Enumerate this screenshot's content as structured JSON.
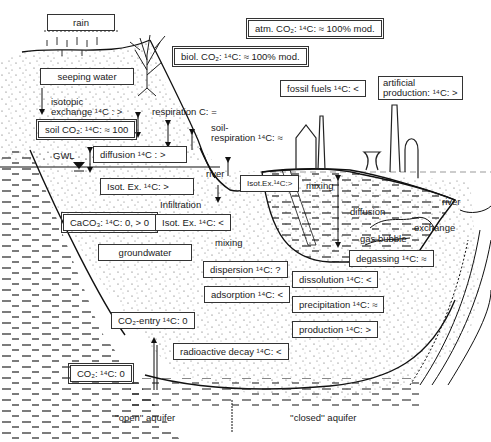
{
  "diagram": {
    "labels": {
      "rain": "rain",
      "atm_co2": "atm. CO₂: ¹⁴C: ≈ 100% mod.",
      "biol_co2": "biol. CO₂: ¹⁴C: ≈ 100% mod.",
      "seeping_water": "seeping water",
      "isotopic_exchange_1": "isotopic",
      "isotopic_exchange_2": "exchange ¹⁴C : >",
      "respiration": "respiration C: =",
      "soil_respiration_1": "soil-",
      "soil_respiration_2": "respiration ¹⁴C: ≈",
      "soil_co2": "soil CO₂: ¹⁴C: ≈ 100",
      "fossil_fuels": "fossil fuels ¹⁴C: <",
      "artificial_1": "artificial",
      "artificial_2": "production: ¹⁴C: >",
      "gwl": "GWL",
      "diffusion_top": "diffusion ¹⁴C : >",
      "river_left": "river",
      "isot_ex_lake": "Isot.Ex.¹⁴C:>",
      "mixing_lake": "mixing",
      "isot_ex_gt": "Isot. Ex. ¹⁴C: >",
      "infiltration": "Infiltration",
      "diffusion_lake": "diffusion",
      "river_right": "river",
      "caco3": "CaCO₃: ¹⁴C: 0, > 0",
      "isot_ex_lt": "Isot. Ex. ¹⁴C: <",
      "gas_bubble": "gas bubble",
      "exchange": "exchange",
      "mixing_mid": "mixing",
      "groundwater": "groundwater",
      "degassing": "degassing ¹⁴C: ≈",
      "dispersion": "dispersion ¹⁴C: ?",
      "dissolution": "dissolution ¹⁴C: <",
      "adsorption": "adsorption ¹⁴C: <",
      "precipitation": "precipitation ¹⁴C: ≈",
      "co2_entry": "CO₂-entry ¹⁴C: 0",
      "production": "production ¹⁴C: >",
      "radioactive_decay": "radioactive decay ¹⁴C: <",
      "co2_bottom": "CO₂: ¹⁴C: 0",
      "open_aquifer": "''open'' aquifer",
      "closed_aquifer": "''closed'' aquifer"
    },
    "icons": [
      "rain-streaks-icon",
      "tree-icon",
      "chimney-icon",
      "cooling-tower-icon",
      "water-level-triangle-icon",
      "arrow-icon"
    ]
  }
}
